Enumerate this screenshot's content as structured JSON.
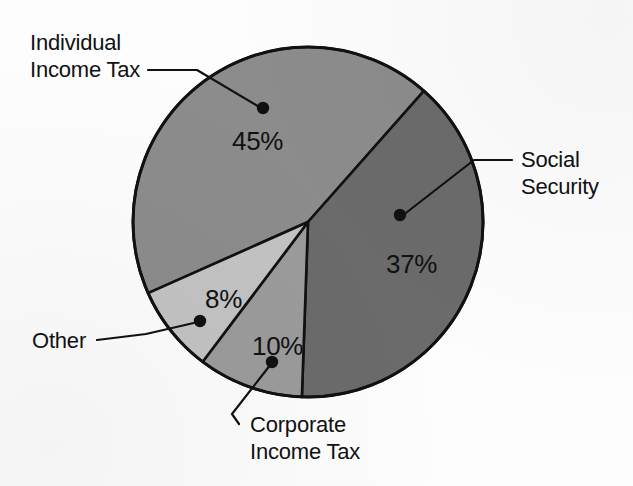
{
  "chart_data": {
    "type": "pie",
    "title": "",
    "subtitle": "",
    "xlabel": "",
    "ylabel": "",
    "legend_position": "callout-labels",
    "grid": false,
    "units": "percent",
    "categories": [
      "Individual Income Tax",
      "Social Security",
      "Corporate Income Tax",
      "Other"
    ],
    "values": [
      45,
      37,
      10,
      8
    ],
    "value_labels": [
      "45%",
      "37%",
      "10%",
      "8%"
    ],
    "slices": [
      {
        "label": "Individual Income Tax",
        "label_lines": [
          "Individual",
          "Income Tax"
        ],
        "value": 45,
        "value_label": "45%",
        "color": "#8c8c8c",
        "start_angle_deg": 246.0,
        "end_angle_deg": 41.5,
        "label_x": 30,
        "label_y": 50,
        "pct_x": 232,
        "pct_y": 150,
        "dot_x": 263,
        "dot_y": 108,
        "leader": "M 148 70 L 197 70 L 261 108"
      },
      {
        "label": "Social Security",
        "label_lines": [
          "Social",
          "Security"
        ],
        "value": 37,
        "value_label": "37%",
        "color": "#6b6b6b",
        "start_angle_deg": 41.5,
        "end_angle_deg": 182.0,
        "label_x": 521,
        "label_y": 167,
        "pct_x": 386,
        "pct_y": 273,
        "dot_x": 400,
        "dot_y": 215,
        "leader": "M 512 160 L 474 160 L 402 216"
      },
      {
        "label": "Corporate Income Tax",
        "label_lines": [
          "Corporate",
          "Income Tax"
        ],
        "value": 10,
        "value_label": "10%",
        "color": "#9b9b9b",
        "start_angle_deg": 182.0,
        "end_angle_deg": 217.0,
        "label_x": 250,
        "label_y": 432,
        "pct_x": 252,
        "pct_y": 355,
        "dot_x": 272,
        "dot_y": 362,
        "leader": "M 239 424 L 232 414 L 271 364"
      },
      {
        "label": "Other",
        "label_lines": [
          "Other"
        ],
        "value": 8,
        "value_label": "8%",
        "color": "#c3c3c3",
        "start_angle_deg": 217.0,
        "end_angle_deg": 246.0,
        "label_x": 32,
        "label_y": 348,
        "pct_x": 205,
        "pct_y": 308,
        "dot_x": 200,
        "dot_y": 321,
        "leader": "M 97 340 L 146 334 L 198 322"
      }
    ],
    "geometry": {
      "center_x": 308,
      "center_y": 222,
      "radius": 175
    },
    "colors": {
      "background": "#fdfdfd",
      "outline": "#111111",
      "text": "#111111"
    }
  }
}
